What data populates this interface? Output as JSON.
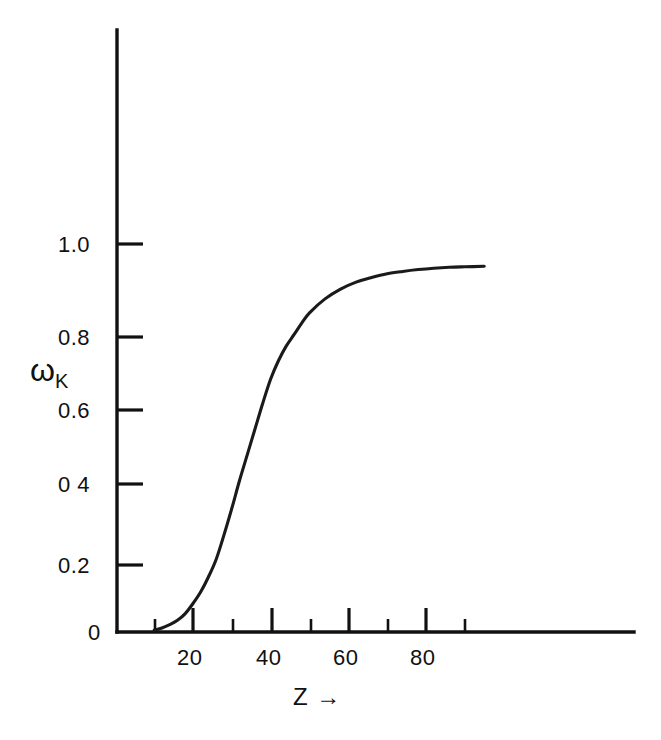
{
  "chart_data": {
    "type": "line",
    "title": "",
    "subtitle": "",
    "xlabel": "Z →",
    "ylabel": "ω",
    "ylabel_sub": "K",
    "xlim": [
      0,
      105
    ],
    "ylim": [
      0,
      1.08
    ],
    "grid": false,
    "legend": null,
    "x_major_ticks": [
      20,
      40,
      60,
      80
    ],
    "x_major_tick_labels": [
      "20",
      "40",
      "60",
      "80"
    ],
    "x_minor_ticks": [
      10,
      30,
      50,
      70,
      90
    ],
    "y_major_ticks": [
      0,
      0.2,
      0.4,
      0.6,
      0.8,
      1.0
    ],
    "y_major_tick_labels": [
      "0",
      "0.2",
      "0 4",
      "0.6",
      "0.8",
      "1.0"
    ],
    "series": [
      {
        "name": "K-shell fluorescence yield",
        "x": [
          10,
          12,
          14,
          16,
          18,
          20,
          22,
          24,
          26,
          28,
          30,
          32,
          34,
          36,
          38,
          40,
          42,
          44,
          46,
          48,
          50,
          54,
          58,
          62,
          66,
          70,
          74,
          78,
          82,
          86,
          90,
          95
        ],
        "y": [
          0.005,
          0.012,
          0.022,
          0.035,
          0.055,
          0.085,
          0.12,
          0.165,
          0.215,
          0.275,
          0.34,
          0.41,
          0.48,
          0.55,
          0.62,
          0.685,
          0.735,
          0.775,
          0.805,
          0.83,
          0.852,
          0.882,
          0.903,
          0.918,
          0.928,
          0.936,
          0.941,
          0.945,
          0.948,
          0.95,
          0.951,
          0.952
        ]
      }
    ]
  },
  "axes": {
    "x_axis_name": "horizontal-axis",
    "y_axis_name": "vertical-axis"
  }
}
